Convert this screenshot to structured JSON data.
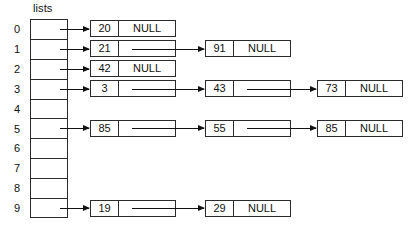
{
  "diagram": {
    "title": "lists",
    "null_label": "NULL",
    "array": {
      "label": "lists",
      "size": 10,
      "indices": [
        "0",
        "1",
        "2",
        "3",
        "4",
        "5",
        "6",
        "7",
        "8",
        "9"
      ]
    },
    "chains": [
      {
        "index": "0",
        "nodes": [
          {
            "value": "20",
            "next": "NULL"
          }
        ]
      },
      {
        "index": "1",
        "nodes": [
          {
            "value": "21",
            "next": ""
          },
          {
            "value": "91",
            "next": "NULL"
          }
        ]
      },
      {
        "index": "2",
        "nodes": [
          {
            "value": "42",
            "next": "NULL"
          }
        ]
      },
      {
        "index": "3",
        "nodes": [
          {
            "value": "3",
            "next": ""
          },
          {
            "value": "43",
            "next": ""
          },
          {
            "value": "73",
            "next": "NULL"
          }
        ]
      },
      {
        "index": "4",
        "nodes": []
      },
      {
        "index": "5",
        "nodes": [
          {
            "value": "85",
            "next": ""
          },
          {
            "value": "55",
            "next": ""
          },
          {
            "value": "85",
            "next": "NULL"
          }
        ]
      },
      {
        "index": "6",
        "nodes": []
      },
      {
        "index": "7",
        "nodes": []
      },
      {
        "index": "8",
        "nodes": []
      },
      {
        "index": "9",
        "nodes": [
          {
            "value": "19",
            "next": ""
          },
          {
            "value": "29",
            "next": "NULL"
          }
        ]
      }
    ],
    "colors": {
      "line": "#2b2b2b",
      "arrow": "#111111",
      "background": "#ffffff",
      "text": "#111111"
    }
  }
}
